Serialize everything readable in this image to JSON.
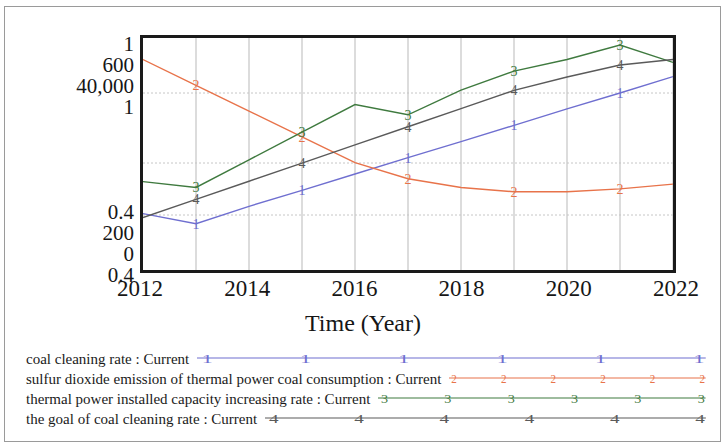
{
  "chart_data": {
    "type": "line",
    "title": "",
    "xlabel": "Time (Year)",
    "ylabel": "",
    "grid": true,
    "legend_position": "below",
    "x": [
      2012,
      2013,
      2014,
      2015,
      2016,
      2017,
      2018,
      2019,
      2020,
      2021,
      2022
    ],
    "xlim": [
      2012,
      2022
    ],
    "xticks": [
      "2012",
      "2014",
      "2016",
      "2018",
      "2020",
      "2022"
    ],
    "y_axis_groups": [
      {
        "ticks": [
          "1",
          "600",
          "40,000",
          "1"
        ]
      },
      {
        "ticks": [
          "0.4",
          "200",
          "0",
          "0.4"
        ]
      }
    ],
    "series": [
      {
        "name": "coal cleaning rate : Current",
        "marker": "1",
        "color": "#6f6fd0",
        "values": [
          0.536,
          0.508,
          0.556,
          0.6,
          0.645,
          0.69,
          0.734,
          0.779,
          0.824,
          0.868,
          0.913
        ]
      },
      {
        "name": "sulfur dioxide emission of thermal power coal consumption : Current",
        "marker": "2",
        "color": "#e8734a",
        "values": [
          560,
          489,
          418,
          347,
          276,
          232,
          208,
          196,
          196,
          204,
          217
        ]
      },
      {
        "name": "thermal power installed capacity increasing rate : Current",
        "marker": "3",
        "color": "#3f7a3f",
        "values": [
          0.624,
          0.608,
          0.684,
          0.76,
          0.836,
          0.808,
          0.876,
          0.928,
          0.96,
          1.0,
          0.952
        ]
      },
      {
        "name": "the goal of coal cleaning rate : Current",
        "marker": "4",
        "color": "#5a5a5a",
        "values": [
          0.525,
          0.575,
          0.625,
          0.675,
          0.725,
          0.775,
          0.825,
          0.875,
          0.912,
          0.945,
          0.96
        ]
      }
    ]
  },
  "axis": {
    "x_title": "Time (Year)",
    "x_ticks": [
      "2012",
      "2014",
      "2016",
      "2018",
      "2020",
      "2022"
    ],
    "y_ticks_top": [
      "1",
      "600",
      "40,000",
      "1"
    ],
    "y_ticks_bottom": [
      "0.4",
      "200",
      "0",
      "0.4"
    ]
  },
  "legend": {
    "entries": [
      {
        "label": "coal cleaning rate : Current",
        "marker": "1",
        "color": "#6f6fd0"
      },
      {
        "label": "sulfur dioxide emission of thermal power coal consumption : Current",
        "marker": "2",
        "color": "#e8734a"
      },
      {
        "label": "thermal power installed capacity increasing rate : Current",
        "marker": "3",
        "color": "#3f7a3f"
      },
      {
        "label": "the goal of coal cleaning rate : Current",
        "marker": "4",
        "color": "#5a5a5a"
      }
    ]
  }
}
